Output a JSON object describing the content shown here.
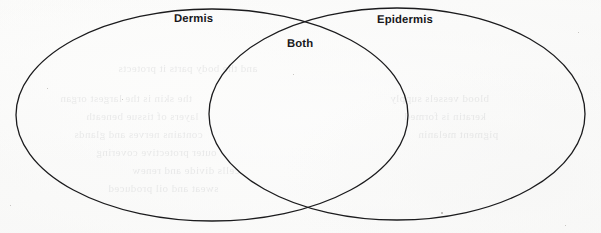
{
  "document": {
    "type": "venn-diagram-worksheet",
    "medium": "scanned-paper",
    "background_color": "#fbfbfa",
    "ink_color": "#1b1b1d"
  },
  "diagram": {
    "type": "venn",
    "set_count": 2,
    "shape": "ellipse",
    "stroke_color": "#1b1b1d",
    "stroke_width": 1.3,
    "fill": "none",
    "left_set": {
      "label": "Dermis",
      "cx": 212,
      "cy": 115,
      "rx": 196,
      "ry": 106
    },
    "right_set": {
      "label": "Epidermis",
      "cx": 397,
      "cy": 114,
      "rx": 188,
      "ry": 106
    },
    "intersection": {
      "label": "Both",
      "top_point": [
        307,
        23
      ],
      "bottom_point": [
        310,
        213
      ]
    }
  },
  "labels": {
    "left": "Dermis",
    "overlap": "Both",
    "right": "Epidermis"
  },
  "ghost_text": [
    {
      "text": "and the body parts it protects",
      "left": 118,
      "top": 62,
      "size": 11
    },
    {
      "text": "the skin is the largest organ",
      "left": 60,
      "top": 92,
      "size": 11
    },
    {
      "text": "layers of tissue beneath",
      "left": 86,
      "top": 110,
      "size": 11
    },
    {
      "text": "contains nerves and glands",
      "left": 74,
      "top": 128,
      "size": 11
    },
    {
      "text": "outer protective covering",
      "left": 96,
      "top": 146,
      "size": 11
    },
    {
      "text": "cells divide and renew",
      "left": 132,
      "top": 164,
      "size": 11
    },
    {
      "text": "sweat and oil produced",
      "left": 108,
      "top": 182,
      "size": 11
    },
    {
      "text": "blood vessels supply",
      "left": 390,
      "top": 92,
      "size": 11
    },
    {
      "text": "keratin is formed",
      "left": 404,
      "top": 110,
      "size": 11
    },
    {
      "text": "pigment melanin",
      "left": 418,
      "top": 128,
      "size": 11
    }
  ]
}
